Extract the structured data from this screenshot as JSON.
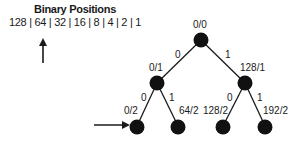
{
  "header": {
    "title": "Binary Positions",
    "positions": "128 | 64 | 32 | 16 | 8 | 4 | 2 | 1"
  },
  "tree": {
    "nodes": [
      {
        "id": "root",
        "label": "0/0"
      },
      {
        "id": "l",
        "label": "0/1"
      },
      {
        "id": "r",
        "label": "128/1"
      },
      {
        "id": "ll",
        "label": "0/2"
      },
      {
        "id": "lr",
        "label": "64/2"
      },
      {
        "id": "rl",
        "label": "128/2"
      },
      {
        "id": "rr",
        "label": "192/2"
      }
    ],
    "edges": [
      {
        "from": "root",
        "to": "l",
        "label": "0"
      },
      {
        "from": "root",
        "to": "r",
        "label": "1"
      },
      {
        "from": "l",
        "to": "ll",
        "label": "0"
      },
      {
        "from": "l",
        "to": "lr",
        "label": "1"
      },
      {
        "from": "r",
        "to": "rl",
        "label": "0"
      },
      {
        "from": "r",
        "to": "rr",
        "label": "1"
      }
    ]
  }
}
